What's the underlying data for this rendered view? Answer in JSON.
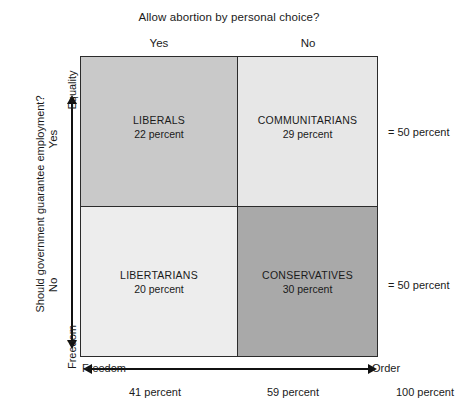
{
  "figure": {
    "top_title": "Allow abortion by personal choice?",
    "left_question": "Should government guarantee employment?",
    "column_headers": [
      {
        "name": "yes",
        "label": "Yes"
      },
      {
        "name": "no",
        "label": "No"
      }
    ],
    "row_headers": [
      {
        "name": "yes",
        "label": "Yes"
      },
      {
        "name": "no",
        "label": "No"
      }
    ],
    "vertical_axis": {
      "top_end": "Equality",
      "bottom_end": "Freedom"
    },
    "horizontal_axis": {
      "left_end": "Freedom",
      "right_end": "Order"
    },
    "row_totals": [
      {
        "name": "top-row-total",
        "label": "= 50 percent"
      },
      {
        "name": "bottom-row-total",
        "label": "= 50 percent"
      }
    ],
    "column_totals": [
      {
        "name": "left-column-total",
        "label": "41 percent"
      },
      {
        "name": "right-column-total",
        "label": "59 percent"
      },
      {
        "name": "grand-total",
        "label": "100 percent"
      }
    ]
  },
  "quadrants": {
    "top_left": {
      "label": "LIBERALS",
      "value": "22 percent",
      "fill": "#c9c9c9"
    },
    "top_right": {
      "label": "COMMUNITARIANS",
      "value": "29 percent",
      "fill": "#e7e7e7"
    },
    "bottom_left": {
      "label": "LIBERTARIANS",
      "value": "20 percent",
      "fill": "#ededed"
    },
    "bottom_right": {
      "label": "CONSERVATIVES",
      "value": "30 percent",
      "fill": "#a9a9a9"
    }
  },
  "chart_data": {
    "type": "heatmap",
    "title": "Allow abortion by personal choice?",
    "xlabel": "Allow abortion by personal choice?",
    "ylabel": "Should government guarantee employment?",
    "x_categories": [
      "Yes",
      "No"
    ],
    "y_categories": [
      "Yes",
      "No"
    ],
    "x_axis_ends": [
      "Freedom",
      "Order"
    ],
    "y_axis_ends": [
      "Freedom",
      "Equality"
    ],
    "cells": [
      {
        "row": "Yes",
        "col": "Yes",
        "group": "LIBERALS",
        "percent": 22,
        "fill": "#c9c9c9"
      },
      {
        "row": "Yes",
        "col": "No",
        "group": "COMMUNITARIANS",
        "percent": 29,
        "fill": "#e7e7e7"
      },
      {
        "row": "No",
        "col": "Yes",
        "group": "LIBERTARIANS",
        "percent": 20,
        "fill": "#ededed"
      },
      {
        "row": "No",
        "col": "No",
        "group": "CONSERVATIVES",
        "percent": 30,
        "fill": "#a9a9a9"
      }
    ],
    "row_margins": [
      {
        "row": "Yes",
        "percent": 50,
        "label": "= 50 percent"
      },
      {
        "row": "No",
        "percent": 50,
        "label": "= 50 percent"
      }
    ],
    "column_margins": [
      {
        "col": "Yes",
        "percent": 41,
        "label": "41 percent"
      },
      {
        "col": "No",
        "percent": 59,
        "label": "59 percent"
      }
    ],
    "total": {
      "percent": 100,
      "label": "100 percent"
    },
    "grid": false,
    "legend": "none"
  }
}
